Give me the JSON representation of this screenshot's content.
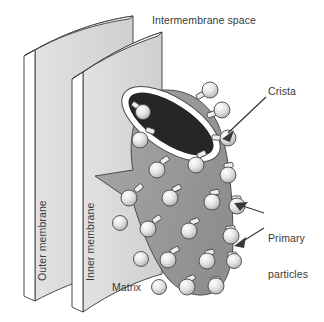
{
  "figure": {
    "background_color": "#ffffff",
    "text_color": "#3a3a3a"
  },
  "labels": {
    "intermembrane_space": "Intermembrane space",
    "crista": "Crista",
    "primary_particles_line1": "Primary",
    "primary_particles_line2": "particles",
    "matrix": "Matrix",
    "outer_membrane": "Outer membrane",
    "inner_membrane": "Inner membrane"
  },
  "colors": {
    "membrane_face": "#d9d9d9",
    "membrane_edge_face": "#ffffff",
    "matrix_body": "#9e9e9e",
    "crista_opening": "#262626",
    "crista_rim": "#ffffff",
    "particle_light": "#f2f2f2",
    "particle_mid": "#c9c9c9",
    "outline": "#4a4a4a"
  },
  "structures": {
    "outer_membrane_panel": "curved-sheet-left",
    "inner_membrane_panel": "curved-sheet-right",
    "crista_body": "gray-tapered-sheet",
    "crista_opening_shape": "dark-ellipse",
    "particle_count": 30
  },
  "leaders": {
    "crista_arrow": "points-down-left-to-crista-rim",
    "primary_upper_arrow": "points-left-to-particle",
    "primary_lower_arrow": "points-left-to-particle"
  }
}
